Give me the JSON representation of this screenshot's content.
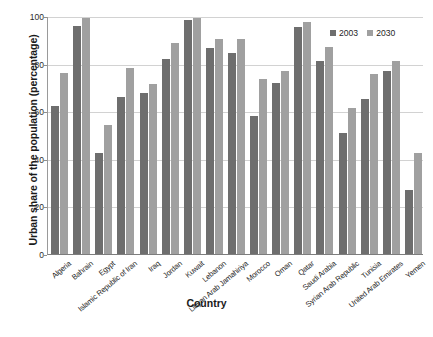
{
  "chart_data": {
    "type": "bar",
    "title": "",
    "subtitle": "",
    "xlabel": "Country",
    "ylabel": "Urban share of the population (percentage)",
    "ylim": [
      0,
      100
    ],
    "yticks": [
      0,
      20,
      40,
      60,
      80,
      100
    ],
    "ytick_labels": [
      "0",
      "20",
      "40",
      "60",
      "80",
      "100"
    ],
    "grid": "horizontal",
    "legend_position": "top-right",
    "categories": [
      "Algeria",
      "Bahrain",
      "Egypt",
      "Islamic Republic of Iran",
      "Iraq",
      "Jordan",
      "Kuwait",
      "Lebanon",
      "Libyan Arab Jamahiriya",
      "Morocco",
      "Oman",
      "Qatar",
      "Saudi Arabia",
      "Syrian Arab Republic",
      "Tunisia",
      "United Arab Emirates",
      "Yemen"
    ],
    "series": [
      {
        "name": "2003",
        "color": "#6e6e6e",
        "values": [
          62,
          96,
          42.5,
          66,
          67.5,
          82,
          98.5,
          86.5,
          84.5,
          58,
          72,
          95.5,
          81,
          51,
          65,
          77,
          27
        ]
      },
      {
        "name": "2030",
        "color": "#a0a0a0",
        "values": [
          76,
          99,
          54,
          78,
          71.5,
          88.5,
          99,
          90.5,
          90.5,
          73.5,
          77,
          97.5,
          87,
          61.5,
          75.5,
          81,
          42.5
        ]
      }
    ]
  }
}
